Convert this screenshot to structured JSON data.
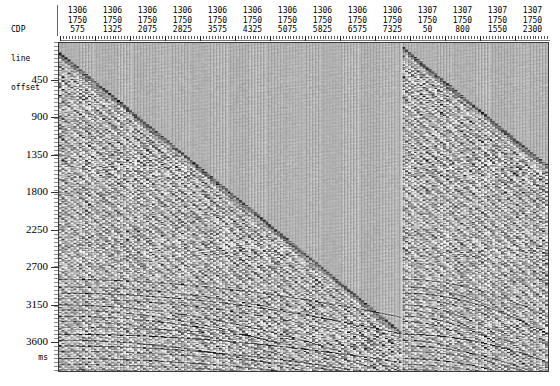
{
  "header": {
    "row_labels": [
      "CDP",
      "line",
      "offset"
    ],
    "columns": [
      {
        "cdp": "1306",
        "line": "1750",
        "offset": "575"
      },
      {
        "cdp": "1306",
        "line": "1750",
        "offset": "1325"
      },
      {
        "cdp": "1306",
        "line": "1750",
        "offset": "2075"
      },
      {
        "cdp": "1306",
        "line": "1750",
        "offset": "2825"
      },
      {
        "cdp": "1306",
        "line": "1750",
        "offset": "3575"
      },
      {
        "cdp": "1306",
        "line": "1750",
        "offset": "4325"
      },
      {
        "cdp": "1306",
        "line": "1750",
        "offset": "5075"
      },
      {
        "cdp": "1306",
        "line": "1750",
        "offset": "5825"
      },
      {
        "cdp": "1306",
        "line": "1750",
        "offset": "6575"
      },
      {
        "cdp": "1306",
        "line": "1750",
        "offset": "7325"
      },
      {
        "cdp": "1307",
        "line": "1750",
        "offset": "50"
      },
      {
        "cdp": "1307",
        "line": "1750",
        "offset": "800"
      },
      {
        "cdp": "1307",
        "line": "1750",
        "offset": "1550"
      },
      {
        "cdp": "1307",
        "line": "1750",
        "offset": "2300"
      }
    ]
  },
  "yaxis": {
    "units_label": "ms",
    "ticks": [
      "450",
      "900",
      "1350",
      "1800",
      "2250",
      "2700",
      "3150",
      "3600"
    ]
  },
  "chart_data": {
    "type": "heatmap",
    "title": "",
    "xlabel": "",
    "ylabel": "ms",
    "x": {
      "variable": "trace (CDP / line / offset)",
      "tick_labels": [
        "575",
        "1325",
        "2075",
        "2825",
        "3575",
        "4325",
        "5075",
        "5825",
        "6575",
        "7325",
        "50",
        "800",
        "1550",
        "2300"
      ],
      "tick_cdp": [
        "1306",
        "1306",
        "1306",
        "1306",
        "1306",
        "1306",
        "1306",
        "1306",
        "1306",
        "1306",
        "1307",
        "1307",
        "1307",
        "1307"
      ],
      "tick_line": [
        "1750",
        "1750",
        "1750",
        "1750",
        "1750",
        "1750",
        "1750",
        "1750",
        "1750",
        "1750",
        "1750",
        "1750",
        "1750",
        "1750"
      ],
      "offset_start": 575,
      "offset_increment": 750,
      "n_traces": 168,
      "gather_break_index": 118
    },
    "y": {
      "variable": "two-way travel time",
      "unit": "ms",
      "min": 0,
      "max": 3960,
      "tick_interval": 450,
      "tick_values": [
        450,
        900,
        1350,
        1800,
        2250,
        2700,
        3150,
        3600
      ],
      "direction": "increasing-downward"
    },
    "grid": false,
    "legend": "none",
    "colors": {
      "background": "#b4b4b4",
      "trace_dark": "#1a1a1a",
      "trace_light": "#f0f0f0",
      "frame": "#3a3a3a",
      "text": "#000000"
    },
    "events": [
      {
        "name": "first-break-refraction-gather-1",
        "type": "linear-diagonal",
        "from": {
          "trace_frac": 0.0,
          "time_ms": 120
        },
        "to": {
          "trace_frac": 0.7,
          "time_ms": 3520
        }
      },
      {
        "name": "first-break-refraction-gather-2",
        "type": "linear-diagonal",
        "from": {
          "trace_frac": 0.7,
          "time_ms": 60
        },
        "to": {
          "trace_frac": 1.0,
          "time_ms": 1500
        }
      },
      {
        "name": "deep-reflection-hyperbolae",
        "type": "hyperbolic-banding",
        "time_range_ms": [
          3000,
          3900
        ]
      }
    ]
  }
}
